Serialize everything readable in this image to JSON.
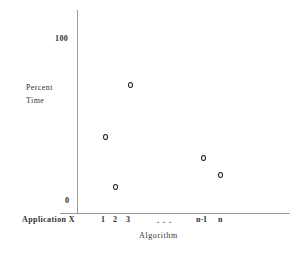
{
  "chart_data": {
    "type": "scatter",
    "title": "",
    "xlabel": "Algorithm",
    "ylabel": "Percent Time",
    "ylabel_lines": [
      "Percent",
      "Time"
    ],
    "row_label": "Application X",
    "ylim": [
      0,
      100
    ],
    "ytick_labels": [
      "100",
      "0"
    ],
    "xtick_labels": [
      "1",
      "2",
      "3",
      "n-1",
      "n"
    ],
    "ellipsis": "...",
    "grid": false,
    "legend": null,
    "marker": "open-circle",
    "categories": [
      "1",
      "2",
      "3",
      "n-1",
      "n"
    ],
    "points": [
      {
        "x": "1",
        "px": 105,
        "py": 137,
        "value": 53
      },
      {
        "x": "2",
        "px": 115,
        "py": 187,
        "value": 14
      },
      {
        "x": "3",
        "px": 130,
        "py": 85,
        "value": 93
      },
      {
        "x": "n-1",
        "px": 203,
        "py": 158,
        "value": 37
      },
      {
        "x": "n",
        "px": 220,
        "py": 175,
        "value": 24
      }
    ],
    "values": [
      53,
      14,
      93,
      37,
      24
    ],
    "axis_color": "#9a9a9a",
    "marker_color": "#1c1c1c",
    "background": "#ffffff"
  },
  "tick_positions": {
    "x": [
      {
        "label": "1",
        "left": 101
      },
      {
        "label": "2",
        "left": 113
      },
      {
        "label": "3",
        "left": 126
      },
      {
        "label": "n-1",
        "left": 196
      },
      {
        "label": "n",
        "left": 218
      }
    ]
  }
}
